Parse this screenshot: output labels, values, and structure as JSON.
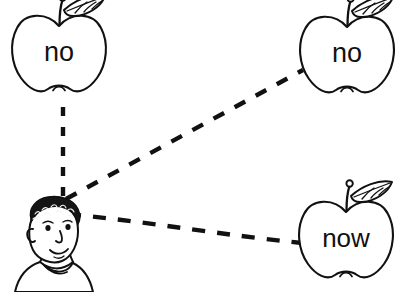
{
  "worksheet": {
    "title": "Word matching activity",
    "background_color": "#ffffff",
    "ink_color": "#111111",
    "canvas": {
      "width": 395,
      "height": 292
    }
  },
  "character": {
    "name": "child-head",
    "description": "Line drawing of a smiling child with curly hair, head and shoulders",
    "position": {
      "x": 12,
      "y": 200,
      "width": 88,
      "height": 92
    },
    "anchor": {
      "x": 63,
      "y": 205
    }
  },
  "apples": [
    {
      "id": "apple-top-left",
      "word": "no",
      "position": {
        "x": 13,
        "y": 8,
        "width": 92,
        "height": 88
      },
      "center": {
        "x": 59,
        "y": 52
      }
    },
    {
      "id": "apple-top-right",
      "word": "no",
      "position": {
        "x": 303,
        "y": 10,
        "width": 88,
        "height": 86
      },
      "center": {
        "x": 347,
        "y": 53
      }
    },
    {
      "id": "apple-bottom-right",
      "word": "now",
      "position": {
        "x": 301,
        "y": 193,
        "width": 90,
        "height": 88
      },
      "center": {
        "x": 346,
        "y": 238
      }
    }
  ],
  "connections": [
    {
      "id": "link-to-apple-top-left",
      "from": "child-head",
      "to": "apple-top-left",
      "style": "dashed",
      "start": {
        "x": 63,
        "y": 196
      },
      "end": {
        "x": 63,
        "y": 100
      }
    },
    {
      "id": "link-to-apple-top-right",
      "from": "child-head",
      "to": "apple-top-right",
      "style": "dashed",
      "start": {
        "x": 66,
        "y": 199
      },
      "end": {
        "x": 303,
        "y": 70
      }
    },
    {
      "id": "link-to-apple-bottom-right",
      "from": "child-head",
      "to": "apple-bottom-right",
      "style": "dashed",
      "start": {
        "x": 68,
        "y": 214
      },
      "end": {
        "x": 302,
        "y": 243
      }
    }
  ]
}
